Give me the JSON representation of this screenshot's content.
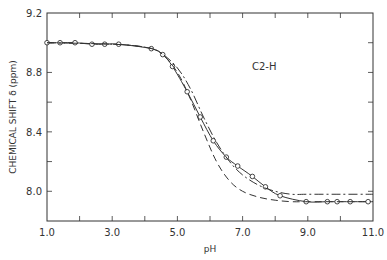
{
  "chart_data": {
    "type": "line",
    "title": "",
    "xlabel": "pH",
    "ylabel": "CHEMICAL SHIFT δ (ppm)",
    "xlim": [
      1.0,
      11.0
    ],
    "ylim": [
      7.8,
      9.2
    ],
    "xticks": [
      "1.0",
      "3.0",
      "5.0",
      "7.0",
      "9.0",
      "11.0"
    ],
    "yticks": [
      "9.2",
      "8.8",
      "8.4",
      "8.0"
    ],
    "grid": false,
    "annotations": [
      {
        "text": "C2-H",
        "x": 7.3,
        "y": 8.84
      }
    ],
    "series": [
      {
        "name": "observed",
        "style": "solid-with-circles",
        "x": [
          1.0,
          1.4,
          1.86,
          2.38,
          2.77,
          3.2,
          4.2,
          4.55,
          4.85,
          5.3,
          5.7,
          6.1,
          6.5,
          6.85,
          7.3,
          7.7,
          8.15,
          8.95,
          9.6,
          9.9,
          10.3,
          10.85
        ],
        "y": [
          9.0,
          9.0,
          9.0,
          8.99,
          8.99,
          8.99,
          8.96,
          8.92,
          8.84,
          8.67,
          8.5,
          8.34,
          8.23,
          8.17,
          8.1,
          8.03,
          7.97,
          7.93,
          7.93,
          7.93,
          7.93,
          7.93
        ]
      },
      {
        "name": "fit-dash-dot",
        "style": "dash-dot",
        "x": [
          1.0,
          3.0,
          4.0,
          4.5,
          5.0,
          5.4,
          5.8,
          6.2,
          6.6,
          7.0,
          7.5,
          8.0,
          8.5,
          9.0,
          10.0,
          11.0
        ],
        "y": [
          9.0,
          8.99,
          8.97,
          8.93,
          8.83,
          8.69,
          8.5,
          8.33,
          8.2,
          8.11,
          8.04,
          8.0,
          7.98,
          7.98,
          7.98,
          7.98
        ]
      },
      {
        "name": "fit-dashed",
        "style": "dashed",
        "x": [
          1.0,
          3.0,
          4.0,
          4.5,
          5.0,
          5.4,
          5.8,
          6.2,
          6.6,
          7.0,
          7.5,
          8.0,
          8.5,
          9.0,
          10.0,
          11.0
        ],
        "y": [
          9.0,
          8.99,
          8.97,
          8.93,
          8.8,
          8.62,
          8.4,
          8.2,
          8.07,
          8.0,
          7.96,
          7.94,
          7.93,
          7.93,
          7.93,
          7.93
        ]
      }
    ]
  },
  "labels": {
    "x_axis_title": "pH",
    "y_axis_title": "CHEMICAL SHIFT δ (ppm)",
    "annotation": "C2-H",
    "x_ticks": [
      "1.0",
      "3.0",
      "5.0",
      "7.0",
      "9.0",
      "11.0"
    ],
    "y_ticks": [
      "9.2",
      "8.8",
      "8.4",
      "8.0"
    ]
  },
  "colors": {
    "ink": "#333333",
    "background": "#ffffff"
  }
}
